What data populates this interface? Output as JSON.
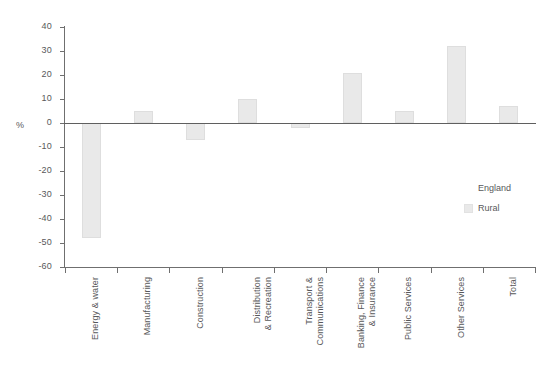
{
  "chart_data": {
    "type": "bar",
    "title": "",
    "xlabel": "",
    "ylabel": "%",
    "ylim": [
      -60,
      40
    ],
    "ytick_step": 10,
    "grid": false,
    "legend_position": "right",
    "legend_title": "England",
    "categories": [
      "Energy & water",
      "Manufacturing",
      "Construction",
      "Distribution\n& Recreation",
      "Transport &\nCommunications",
      "Banking, Finance\n& Insurance",
      "Public Services",
      "Other Services",
      "Total"
    ],
    "series": [
      {
        "name": "Rural",
        "color": "#e9e9e9",
        "values": [
          -48,
          5,
          -7,
          10,
          -2,
          21,
          5,
          32,
          7
        ]
      }
    ],
    "ytick_labels": [
      "40",
      "30",
      "20",
      "10",
      "0",
      "-10",
      "-20",
      "-30",
      "-40",
      "-50",
      "-60"
    ]
  },
  "axis": {
    "unit_label": "%"
  },
  "legend": {
    "title": "England",
    "entries": [
      {
        "label": "Rural",
        "color": "#e9e9e9"
      }
    ]
  }
}
